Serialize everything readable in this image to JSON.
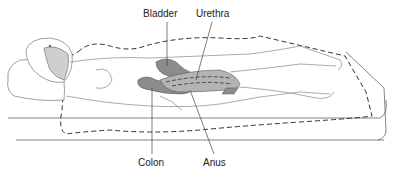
{
  "diagram": {
    "labels": {
      "bladder": "Bladder",
      "urethra": "Urethra",
      "colon": "Colon",
      "anus": "Anus"
    },
    "colors": {
      "organ_fill": "#8c8c8c",
      "organ_fill_light": "#b4b4b4",
      "line": "#555555",
      "dashed_outline": "#333333",
      "skin_shade": "#c8c8c8"
    }
  }
}
